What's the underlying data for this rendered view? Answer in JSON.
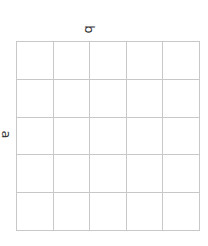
{
  "diagram": {
    "type": "grid",
    "rows": 5,
    "columns": 5,
    "labels": {
      "top": "b",
      "left": "a"
    },
    "line_color": "#c8c8c8"
  }
}
